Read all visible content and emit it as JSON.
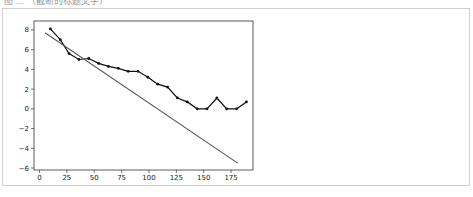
{
  "caption": "图 ... （截断的标题文字）",
  "chart_data": {
    "type": "line",
    "title": "",
    "xlabel": "",
    "ylabel": "",
    "xlim": [
      -5,
      195
    ],
    "ylim": [
      -6.2,
      8.9
    ],
    "grid": false,
    "legend": null,
    "x_ticks": [
      0,
      25,
      50,
      75,
      100,
      125,
      150,
      175
    ],
    "y_ticks": [
      8,
      6,
      4,
      2,
      0,
      -2,
      -4,
      -6
    ],
    "x_tick_labels": [
      "0",
      "25",
      "50",
      "75",
      "100",
      "125",
      "150",
      "175"
    ],
    "y_tick_labels": [
      "8",
      "6",
      "4",
      "2",
      "0",
      "−2",
      "−4",
      "−6"
    ],
    "series": [
      {
        "name": "data",
        "style": "line-with-markers",
        "color": "#111111",
        "x": [
          10,
          19,
          27,
          36,
          45,
          54,
          63,
          72,
          81,
          90,
          99,
          108,
          117,
          126,
          135,
          144,
          153,
          162,
          171,
          180,
          189
        ],
        "y": [
          8.1,
          7.0,
          5.6,
          5.0,
          5.1,
          4.6,
          4.3,
          4.1,
          3.8,
          3.8,
          3.2,
          2.5,
          2.2,
          1.1,
          0.7,
          0.0,
          0.0,
          1.1,
          0.0,
          0.0,
          0.7
        ]
      },
      {
        "name": "fit",
        "style": "line",
        "color": "#555555",
        "x": [
          5,
          181
        ],
        "y": [
          7.7,
          -5.5
        ]
      }
    ]
  }
}
